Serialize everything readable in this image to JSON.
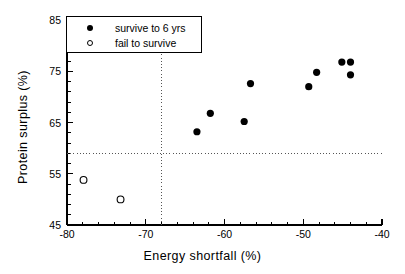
{
  "chart_data": {
    "type": "scatter",
    "title": "",
    "xlabel": "Energy  shortfall  (%)",
    "ylabel": "Protein  surplus  (%)",
    "xlim": [
      -80,
      -40
    ],
    "ylim": [
      45,
      85
    ],
    "xticks": [
      -80,
      -70,
      -60,
      -50,
      -40
    ],
    "xticklabels": [
      "-80",
      "-70",
      "-60",
      "-50",
      "-40"
    ],
    "yticks": [
      45,
      55,
      65,
      75,
      85
    ],
    "yticklabels": [
      "45",
      "55",
      "65",
      "75",
      "85"
    ],
    "x_minor_tick_step": 2,
    "y_minor_tick_step": 2,
    "grid": false,
    "legend_position": "upper-left",
    "reference_lines": [
      {
        "orientation": "horizontal",
        "value": 59.0,
        "style": "dotted"
      },
      {
        "orientation": "vertical",
        "value": -68.0,
        "style": "dotted"
      }
    ],
    "series": [
      {
        "name": "survive to 6 yrs",
        "marker": "filled-circle",
        "color": "#000000",
        "points": [
          {
            "x": -63.5,
            "y": 63.2
          },
          {
            "x": -61.8,
            "y": 66.8
          },
          {
            "x": -57.5,
            "y": 65.2
          },
          {
            "x": -56.7,
            "y": 72.6
          },
          {
            "x": -49.3,
            "y": 72.0
          },
          {
            "x": -48.3,
            "y": 74.8
          },
          {
            "x": -45.1,
            "y": 76.8
          },
          {
            "x": -44.0,
            "y": 76.8
          },
          {
            "x": -44.0,
            "y": 74.3
          }
        ]
      },
      {
        "name": "fail to survive",
        "marker": "open-circle",
        "color": "#000000",
        "points": [
          {
            "x": -77.9,
            "y": 53.8
          },
          {
            "x": -73.2,
            "y": 50.0
          }
        ]
      }
    ]
  },
  "legend": {
    "entries": [
      {
        "label": "survive to 6 yrs",
        "marker": "filled-circle"
      },
      {
        "label": "fail to survive",
        "marker": "open-circle"
      }
    ]
  },
  "colors": {
    "axis": "#000000",
    "marker": "#000000",
    "reference_line": "#555555",
    "background": "#ffffff"
  }
}
